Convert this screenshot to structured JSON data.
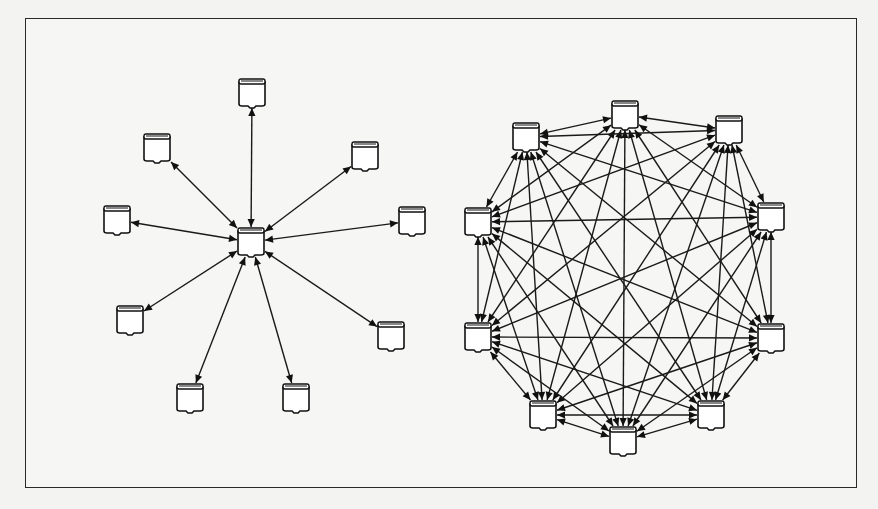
{
  "diagram": {
    "title": "",
    "frame": {
      "x": 25,
      "y": 18,
      "width": 832,
      "height": 470,
      "border_color": "#2a2a2a"
    },
    "node_icon": "database-cylinder-icon",
    "node_size": {
      "width": 26,
      "height": 28
    },
    "colors": {
      "line": "#1a1a1a",
      "node_fill": "#ffffff",
      "background": "#f6f6f4"
    },
    "topologies": [
      {
        "name": "star-topology",
        "description": "Centralized: one hub node connected to 9 peripheral nodes with bidirectional arrows",
        "hub": {
          "id": "hub",
          "x": 251,
          "y": 242
        },
        "nodes": [
          {
            "id": "s1",
            "x": 252,
            "y": 93
          },
          {
            "id": "s2",
            "x": 157,
            "y": 148
          },
          {
            "id": "s3",
            "x": 365,
            "y": 156
          },
          {
            "id": "s4",
            "x": 117,
            "y": 220
          },
          {
            "id": "s5",
            "x": 412,
            "y": 221
          },
          {
            "id": "s6",
            "x": 130,
            "y": 320
          },
          {
            "id": "s7",
            "x": 391,
            "y": 336
          },
          {
            "id": "s8",
            "x": 190,
            "y": 398
          },
          {
            "id": "s9",
            "x": 296,
            "y": 398
          }
        ],
        "edges": "hub-to-each-node"
      },
      {
        "name": "full-mesh-topology",
        "description": "Distributed: 10 nodes arranged in a ring, every node connected to every other node with bidirectional arrows",
        "nodes": [
          {
            "id": "m1",
            "x": 625,
            "y": 115
          },
          {
            "id": "m2",
            "x": 729,
            "y": 130
          },
          {
            "id": "m3",
            "x": 771,
            "y": 217
          },
          {
            "id": "m4",
            "x": 771,
            "y": 338
          },
          {
            "id": "m5",
            "x": 711,
            "y": 415
          },
          {
            "id": "m6",
            "x": 623,
            "y": 441
          },
          {
            "id": "m7",
            "x": 543,
            "y": 415
          },
          {
            "id": "m8",
            "x": 478,
            "y": 337
          },
          {
            "id": "m9",
            "x": 478,
            "y": 222
          },
          {
            "id": "m10",
            "x": 526,
            "y": 137
          }
        ],
        "edges": "complete-graph"
      }
    ]
  }
}
